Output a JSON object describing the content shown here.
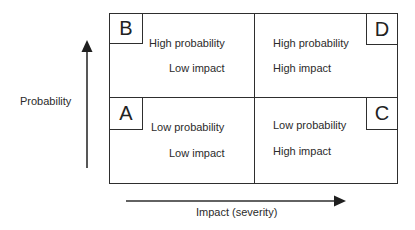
{
  "diagram": {
    "type": "risk-matrix-2x2",
    "y_axis": {
      "label": "Probability",
      "direction": "up"
    },
    "x_axis": {
      "label": "Impact (severity)",
      "direction": "right"
    },
    "quadrants": {
      "top_left": {
        "letter": "B",
        "line1": "High probability",
        "line2": "Low impact"
      },
      "top_right": {
        "letter": "D",
        "line1": "High probability",
        "line2": "High impact"
      },
      "bottom_left": {
        "letter": "A",
        "line1": "Low probability",
        "line2": "Low impact"
      },
      "bottom_right": {
        "letter": "C",
        "line1": "Low probability",
        "line2": "High impact"
      }
    },
    "colors": {
      "line": "#2e2e2e",
      "text": "#2b2b2b",
      "background": "#ffffff"
    }
  }
}
